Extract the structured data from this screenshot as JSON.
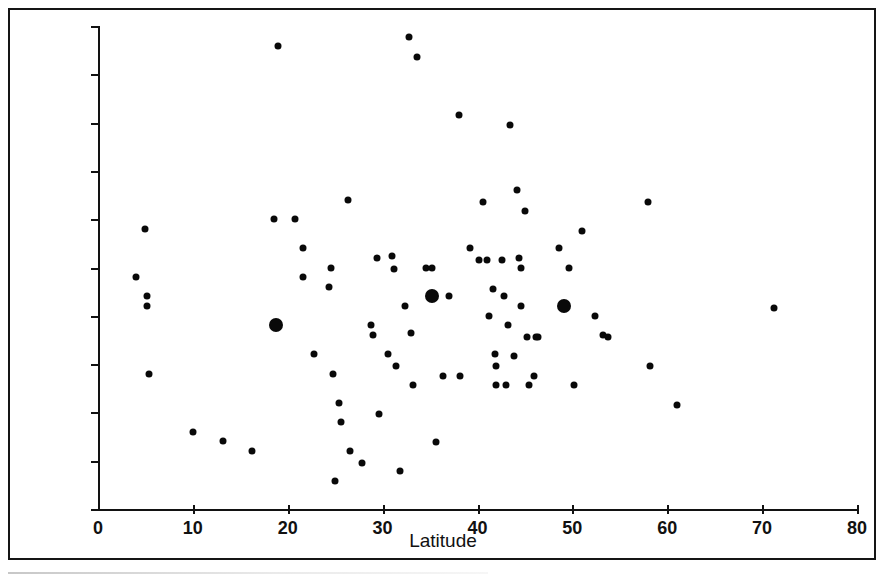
{
  "figure": {
    "background_color": "#ffffff",
    "marker_color": "#090909",
    "axis_color": "#121212",
    "has_outer_frame": true,
    "frame_color": "#151515"
  },
  "chart_data": {
    "type": "scatter",
    "title": "",
    "xlabel": "Latitude",
    "ylabel": "Penicillia as percent of total species",
    "xlim": [
      0,
      80
    ],
    "ylim": [
      0,
      50
    ],
    "xticks": [
      0,
      10,
      20,
      30,
      40,
      50,
      60,
      70,
      80
    ],
    "yticks": [
      0,
      5,
      10,
      15,
      20,
      25,
      30,
      35,
      40,
      45,
      50
    ],
    "xtick_labels": [
      "0",
      "10",
      "20",
      "30",
      "40",
      "50",
      "60",
      "70",
      "80"
    ],
    "ytick_labels": [
      "0",
      "5",
      "10",
      "15",
      "20",
      "25",
      "30",
      "35",
      "40",
      "45",
      "50"
    ],
    "grid": false,
    "legend": null,
    "legend_position": "none",
    "marker_sizes": {
      "small": 7,
      "large": 14
    },
    "series": [
      {
        "name": "Individual surveys",
        "marker": "small-filled-circle",
        "points": [
          [
            4.0,
            24.0
          ],
          [
            5.0,
            29.0
          ],
          [
            5.2,
            22.0
          ],
          [
            5.2,
            21.0
          ],
          [
            5.4,
            14.0
          ],
          [
            10.0,
            8.0
          ],
          [
            13.2,
            7.0
          ],
          [
            16.2,
            6.0
          ],
          [
            18.6,
            30.0
          ],
          [
            19.0,
            47.9
          ],
          [
            20.8,
            30.0
          ],
          [
            21.6,
            27.0
          ],
          [
            21.6,
            24.0
          ],
          [
            22.8,
            16.0
          ],
          [
            24.4,
            23.0
          ],
          [
            24.6,
            25.0
          ],
          [
            24.8,
            14.0
          ],
          [
            25.0,
            2.9
          ],
          [
            25.4,
            11.0
          ],
          [
            25.6,
            9.0
          ],
          [
            26.4,
            32.0
          ],
          [
            26.6,
            6.0
          ],
          [
            27.8,
            4.8
          ],
          [
            28.8,
            19.0
          ],
          [
            29.0,
            18.0
          ],
          [
            29.4,
            26.0
          ],
          [
            29.6,
            9.8
          ],
          [
            30.6,
            16.0
          ],
          [
            31.0,
            26.2
          ],
          [
            31.2,
            24.8
          ],
          [
            31.4,
            14.8
          ],
          [
            31.8,
            3.9
          ],
          [
            32.4,
            21.0
          ],
          [
            32.8,
            48.9
          ],
          [
            33.0,
            18.2
          ],
          [
            33.2,
            12.8
          ],
          [
            33.6,
            46.8
          ],
          [
            34.6,
            25.0
          ],
          [
            35.2,
            25.0
          ],
          [
            35.6,
            6.9
          ],
          [
            36.4,
            13.8
          ],
          [
            37.0,
            22.0
          ],
          [
            38.0,
            40.8
          ],
          [
            38.2,
            13.8
          ],
          [
            39.2,
            27.0
          ],
          [
            40.2,
            25.8
          ],
          [
            40.6,
            31.8
          ],
          [
            41.0,
            25.8
          ],
          [
            41.2,
            20.0
          ],
          [
            41.6,
            22.8
          ],
          [
            41.8,
            16.0
          ],
          [
            42.0,
            14.8
          ],
          [
            42.0,
            12.8
          ],
          [
            42.6,
            25.8
          ],
          [
            42.8,
            22.0
          ],
          [
            43.0,
            12.8
          ],
          [
            43.2,
            19.0
          ],
          [
            43.4,
            39.7
          ],
          [
            43.8,
            15.8
          ],
          [
            44.2,
            33.0
          ],
          [
            44.4,
            26.0
          ],
          [
            44.6,
            25.0
          ],
          [
            44.6,
            21.0
          ],
          [
            45.0,
            30.8
          ],
          [
            45.2,
            17.8
          ],
          [
            45.4,
            12.8
          ],
          [
            46.0,
            13.8
          ],
          [
            46.2,
            17.8
          ],
          [
            46.4,
            17.8
          ],
          [
            48.6,
            27.0
          ],
          [
            49.6,
            25.0
          ],
          [
            50.2,
            12.8
          ],
          [
            51.0,
            28.8
          ],
          [
            52.4,
            20.0
          ],
          [
            53.2,
            18.0
          ],
          [
            53.8,
            17.8
          ],
          [
            58.0,
            31.8
          ],
          [
            58.2,
            14.8
          ],
          [
            61.0,
            10.8
          ],
          [
            71.2,
            20.8
          ]
        ]
      },
      {
        "name": "Regional means",
        "marker": "large-filled-circle",
        "points": [
          [
            18.8,
            19.0
          ],
          [
            35.2,
            22.0
          ],
          [
            49.1,
            21.0
          ]
        ]
      }
    ]
  }
}
